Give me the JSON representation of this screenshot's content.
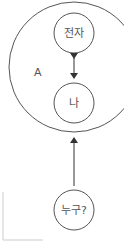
{
  "diagram": {
    "outer_region": {
      "label": "A"
    },
    "nodes": [
      {
        "id": "electron",
        "label": "전자"
      },
      {
        "id": "me",
        "label": "나"
      },
      {
        "id": "who",
        "label": "누구?"
      }
    ],
    "edges": [
      {
        "from": "electron",
        "to": "me",
        "type": "bidirectional"
      },
      {
        "from": "who",
        "to": "outer_region",
        "type": "directed"
      }
    ],
    "colors": {
      "stroke": "#444444",
      "text": "#555555",
      "background": "#ffffff"
    }
  }
}
